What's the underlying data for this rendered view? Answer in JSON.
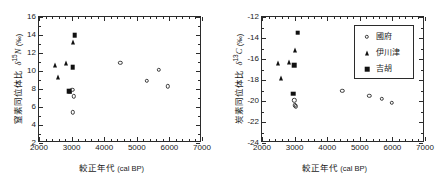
{
  "figure": {
    "background": "#ffffff",
    "marker_fill": "#111111",
    "marker_open_stroke": "#3a3a3a",
    "axis_color": "#2b2b2b"
  },
  "legend": {
    "position": "top-right-of-right-panel",
    "items": [
      {
        "label": "國府",
        "marker": "open-circle"
      },
      {
        "label": "伊川津",
        "marker": "filled-triangle"
      },
      {
        "label": "吉胡",
        "marker": "filled-square"
      }
    ]
  },
  "chart_data": [
    {
      "id": "nitrogen-panel",
      "type": "scatter",
      "title": "",
      "xlabel": "較正年代 (cal BP)",
      "ylabel": "窒素同位体比  δ15N (‰)",
      "ylabel_parts": {
        "name": "窒素同位体比",
        "symbol": "δ",
        "sup": "15",
        "element": "N",
        "unit": "(‰)"
      },
      "xlabel_parts": {
        "name": "較正年代",
        "unit": "(cal BP)"
      },
      "xlim": [
        2000,
        7000
      ],
      "ylim": [
        2,
        16
      ],
      "xticks": [
        2000,
        3000,
        4000,
        5000,
        6000,
        7000
      ],
      "yticks": [
        2,
        4,
        6,
        8,
        10,
        12,
        14,
        16
      ],
      "x_minor_count": 4,
      "y_minor_count": 1,
      "grid": false,
      "series": [
        {
          "name": "國府",
          "marker": "open-circle",
          "points": [
            {
              "x": 3020,
              "y": 7.9
            },
            {
              "x": 3060,
              "y": 7.2
            },
            {
              "x": 3030,
              "y": 5.4
            },
            {
              "x": 4490,
              "y": 10.9
            },
            {
              "x": 5300,
              "y": 8.9
            },
            {
              "x": 5680,
              "y": 10.1
            },
            {
              "x": 5960,
              "y": 8.3
            }
          ]
        },
        {
          "name": "伊川津",
          "marker": "filled-triangle",
          "points": [
            {
              "x": 2480,
              "y": 10.7
            },
            {
              "x": 2590,
              "y": 9.35
            },
            {
              "x": 2820,
              "y": 10.9
            },
            {
              "x": 3050,
              "y": 13.2
            },
            {
              "x": 2950,
              "y": 7.75
            }
          ]
        },
        {
          "name": "吉胡",
          "marker": "filled-square",
          "points": [
            {
              "x": 3100,
              "y": 14.0
            },
            {
              "x": 3040,
              "y": 10.4
            },
            {
              "x": 2930,
              "y": 7.75
            }
          ]
        }
      ]
    },
    {
      "id": "carbon-panel",
      "type": "scatter",
      "title": "",
      "xlabel": "較正年代 (cal BP)",
      "ylabel": "炭素同位体比  δ13C (‰)",
      "ylabel_parts": {
        "name": "炭素同位体比",
        "symbol": "δ",
        "sup": "13",
        "element": "C",
        "unit": "(‰)"
      },
      "xlabel_parts": {
        "name": "較正年代",
        "unit": "(cal BP)"
      },
      "xlim": [
        2000,
        7000
      ],
      "ylim": [
        -24,
        -12
      ],
      "xticks": [
        2000,
        3000,
        4000,
        5000,
        6000,
        7000
      ],
      "yticks": [
        -24,
        -22,
        -20,
        -18,
        -16,
        -14,
        -12
      ],
      "x_minor_count": 4,
      "y_minor_count": 1,
      "grid": false,
      "series": [
        {
          "name": "國府",
          "marker": "open-circle",
          "points": [
            {
              "x": 2990,
              "y": -19.95
            },
            {
              "x": 3010,
              "y": -20.4
            },
            {
              "x": 3040,
              "y": -20.5
            },
            {
              "x": 4460,
              "y": -19.05
            },
            {
              "x": 5290,
              "y": -19.5
            },
            {
              "x": 5670,
              "y": -19.8
            },
            {
              "x": 5980,
              "y": -20.2
            }
          ]
        },
        {
          "name": "伊川津",
          "marker": "filled-triangle",
          "points": [
            {
              "x": 2480,
              "y": -16.4
            },
            {
              "x": 2580,
              "y": -17.8
            },
            {
              "x": 2820,
              "y": -16.3
            },
            {
              "x": 3020,
              "y": -15.15
            }
          ]
        },
        {
          "name": "吉胡",
          "marker": "filled-square",
          "points": [
            {
              "x": 3100,
              "y": -13.5
            },
            {
              "x": 2980,
              "y": -16.6
            },
            {
              "x": 2960,
              "y": -19.3
            }
          ]
        }
      ]
    }
  ]
}
